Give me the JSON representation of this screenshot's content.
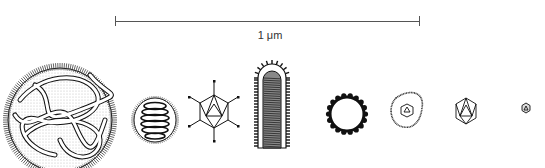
{
  "figure": {
    "type": "virus size comparison",
    "scale_bar": {
      "label": "1 μm",
      "length_px": 305
    },
    "items": [
      {
        "id": "large-complex-virus",
        "description": "large spherical particle with tangled coiled strands and fringe of surface spikes"
      },
      {
        "id": "helical-coil-virus",
        "description": "small round particle with stacked helical coil and fringe"
      },
      {
        "id": "spiked-icosahedral-virus",
        "description": "icosahedral capsid with fibers projecting from vertices"
      },
      {
        "id": "rod-shaped-virus",
        "description": "elongated bullet/rod shaped particle with striated interior and peplomer fringe"
      },
      {
        "id": "knobbed-ring-virus",
        "description": "ring-shaped particle with knobs around perimeter"
      },
      {
        "id": "enveloped-icosahedral-virus",
        "description": "small icosahedral core within fringed envelope"
      },
      {
        "id": "icosahedral-virus",
        "description": "medium icosahedral capsid"
      },
      {
        "id": "tiny-icosahedral-virus",
        "description": "very small icosahedral particle"
      }
    ]
  },
  "colors": {
    "ink": "#1a1a1a",
    "background": "#ffffff",
    "scale": "#555555"
  }
}
